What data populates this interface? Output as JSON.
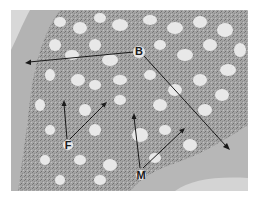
{
  "figure": {
    "colors": {
      "marrow": "#a8a8a8",
      "fat_cells": "#e6e6e6",
      "bone": "#b5b5b5",
      "background": "#ffffff",
      "arrows": "#1a1a1a"
    },
    "labels": [
      {
        "id": "B",
        "text": "B",
        "meaning": "bone",
        "x": 139,
        "y": 51,
        "arrow_targets": [
          [
            25,
            63
          ],
          [
            230,
            150
          ]
        ]
      },
      {
        "id": "F",
        "text": "F",
        "meaning": "fat cells",
        "x": 68,
        "y": 146,
        "arrow_targets": [
          [
            64,
            100
          ],
          [
            107,
            102
          ]
        ]
      },
      {
        "id": "M",
        "text": "M",
        "meaning": "marrow",
        "x": 140,
        "y": 176,
        "arrow_targets": [
          [
            134,
            113
          ],
          [
            185,
            128
          ]
        ]
      }
    ]
  }
}
